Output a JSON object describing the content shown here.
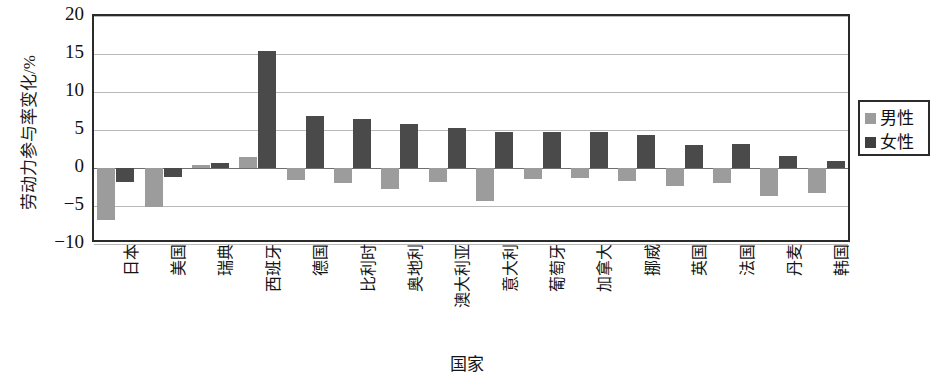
{
  "chart_data": {
    "type": "bar",
    "title": "",
    "xlabel": "国家",
    "ylabel": "劳动力参与率变化/%",
    "ylim": [
      -10,
      20
    ],
    "yticks": [
      20,
      15,
      10,
      5,
      0,
      -5,
      -10
    ],
    "grid": true,
    "legend_position": "right",
    "categories": [
      "日本",
      "美国",
      "瑞典",
      "西班牙",
      "德国",
      "比利时",
      "奥地利",
      "澳大利亚",
      "意大利",
      "葡萄牙",
      "加拿大",
      "挪威",
      "英国",
      "法国",
      "丹麦",
      "韩国"
    ],
    "series": [
      {
        "name": "男性",
        "color": "#9c9c9c",
        "values": [
          -6.8,
          -5.1,
          0.4,
          1.4,
          -1.6,
          -2.0,
          -2.8,
          -1.8,
          -4.3,
          -1.4,
          -1.3,
          -1.7,
          -2.4,
          -2.0,
          -3.7,
          -3.3
        ]
      },
      {
        "name": "女性",
        "color": "#4a4a4a",
        "values": [
          -1.9,
          -1.2,
          0.7,
          15.4,
          6.9,
          6.5,
          5.8,
          5.2,
          4.8,
          4.7,
          4.7,
          4.4,
          3.0,
          3.1,
          1.6,
          0.9
        ]
      }
    ]
  },
  "legend": {
    "items": [
      {
        "label": "男性",
        "color": "#9c9c9c"
      },
      {
        "label": "女性",
        "color": "#3f3f3f"
      }
    ]
  },
  "axes": {
    "y_title": "劳动力参与率变化/%",
    "x_title": "国家"
  }
}
